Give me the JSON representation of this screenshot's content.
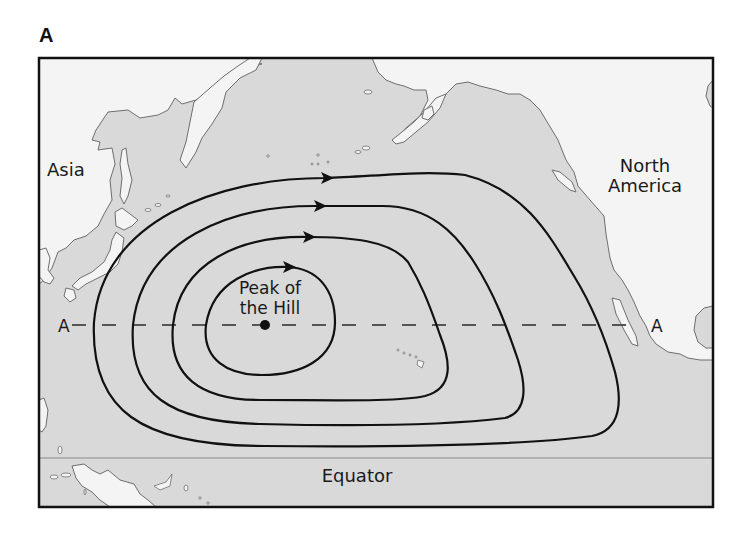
{
  "panel_label": "A",
  "colors": {
    "ocean": "#d9d9d9",
    "land": "#f4f4f4",
    "coast": "#6e6e6e",
    "contour": "#111111",
    "equator_line": "#8a8a8a",
    "dash_line": "#555555",
    "border": "#111111"
  },
  "labels": {
    "asia": "Asia",
    "north_america_line1": "North",
    "north_america_line2": "America",
    "peak_line1": "Peak of",
    "peak_line2": "the Hill",
    "equator": "Equator",
    "section_left": "A",
    "section_right": "A"
  },
  "contours": [
    {
      "name": "contour-1-inner",
      "arrow_at": [
        287,
        267
      ]
    },
    {
      "name": "contour-2",
      "arrow_at": [
        307,
        237
      ]
    },
    {
      "name": "contour-3",
      "arrow_at": [
        318,
        206
      ]
    },
    {
      "name": "contour-4-outer",
      "arrow_at": [
        325,
        178
      ]
    }
  ],
  "peak_point": [
    265,
    325
  ],
  "section_line_y": 325,
  "equator_y": 458
}
